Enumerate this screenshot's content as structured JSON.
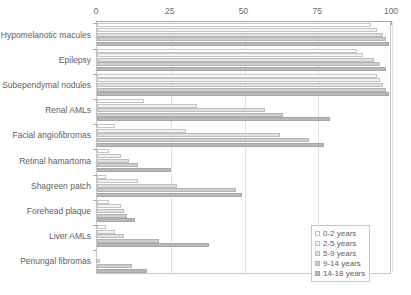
{
  "chart_data": {
    "type": "bar",
    "orientation": "horizontal",
    "title": "",
    "xlabel": "",
    "ylabel": "",
    "xlim": [
      0,
      100
    ],
    "xticks": [
      0,
      25,
      50,
      75,
      100
    ],
    "grid": true,
    "legend_position": "bottom-right",
    "categories": [
      "Hypomelanotic macules",
      "Epilepsy",
      "Subependymal nodules",
      "Renal AMLs",
      "Facial angiofibromas",
      "Retinal hamartoma",
      "Shagreen patch",
      "Forehead plaque",
      "Liver AMLs",
      "Periungal fibromas"
    ],
    "series": [
      {
        "name": "0-2 years",
        "values": [
          93,
          88,
          95,
          16,
          6,
          4,
          3,
          4,
          3,
          0
        ]
      },
      {
        "name": "2-5 years",
        "values": [
          95,
          90,
          96,
          34,
          30,
          8,
          14,
          8,
          6,
          0
        ]
      },
      {
        "name": "5-9 years",
        "values": [
          97,
          94,
          97,
          57,
          62,
          11,
          27,
          9,
          9,
          1
        ]
      },
      {
        "name": "9-14 years",
        "values": [
          98,
          96,
          98,
          63,
          72,
          14,
          47,
          10,
          21,
          12
        ]
      },
      {
        "name": "14-18 years",
        "values": [
          99,
          98,
          99,
          79,
          77,
          25,
          49,
          13,
          38,
          17
        ]
      }
    ]
  },
  "legend": {
    "items": [
      {
        "label": "0-2 years"
      },
      {
        "label": "2-5 years"
      },
      {
        "label": "5-9 years"
      },
      {
        "label": "9-14 years"
      },
      {
        "label": "14-18 years"
      }
    ]
  }
}
